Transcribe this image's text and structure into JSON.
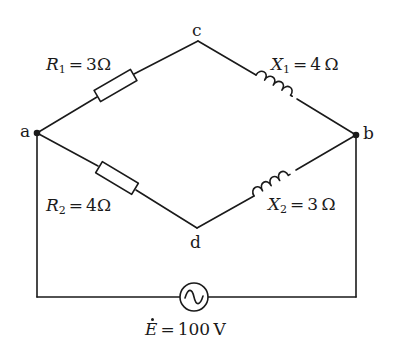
{
  "diagram": {
    "type": "AC bridge circuit",
    "colors": {
      "stroke": "#1a1a1a",
      "background": "#ffffff"
    },
    "nodes": {
      "a": {
        "label": "a"
      },
      "b": {
        "label": "b"
      },
      "c": {
        "label": "c"
      },
      "d": {
        "label": "d"
      }
    },
    "components": {
      "R1": {
        "symbol": "R",
        "sub": "1",
        "eq": "=",
        "value": "3",
        "unit": "Ω",
        "kind": "resistor",
        "between": "a-c"
      },
      "X1": {
        "symbol": "X",
        "sub": "1",
        "eq": "=",
        "value": "4",
        "unit": "Ω",
        "kind": "inductor",
        "between": "c-b"
      },
      "R2": {
        "symbol": "R",
        "sub": "2",
        "eq": "=",
        "value": "4",
        "unit": "Ω",
        "kind": "resistor",
        "between": "a-d"
      },
      "X2": {
        "symbol": "X",
        "sub": "2",
        "eq": "=",
        "value": "3",
        "unit": "Ω",
        "kind": "inductor",
        "between": "d-b"
      },
      "E": {
        "symbol": "E",
        "eq": "=",
        "value": "100",
        "unit": "V",
        "kind": "ac-source",
        "between": "a-b"
      }
    }
  }
}
